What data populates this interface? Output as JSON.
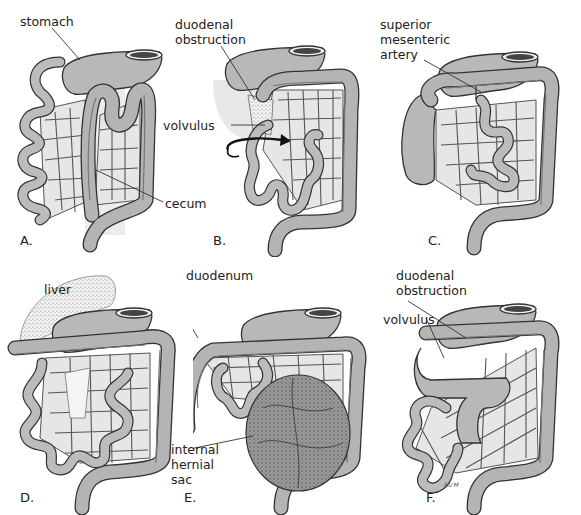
{
  "figure": {
    "panels": [
      {
        "id": "A",
        "panel_label": "A.",
        "callouts": [
          {
            "text": "stomach"
          },
          {
            "text": "cecum"
          }
        ]
      },
      {
        "id": "B",
        "panel_label": "B.",
        "callouts": [
          {
            "text": "duodenal\nobstruction"
          },
          {
            "text": "volvulus"
          }
        ]
      },
      {
        "id": "C",
        "panel_label": "C.",
        "callouts": [
          {
            "text": "superior\nmesenteric\nartery"
          }
        ]
      },
      {
        "id": "D",
        "panel_label": "D.",
        "callouts": [
          {
            "text": "liver"
          }
        ]
      },
      {
        "id": "E",
        "panel_label": "E.",
        "callouts": [
          {
            "text": "duodenum"
          },
          {
            "text": "internal\nhernial\nsac"
          }
        ]
      },
      {
        "id": "F",
        "panel_label": "F.",
        "callouts": [
          {
            "text": "duodenal\nobstruction"
          },
          {
            "text": "volvulus"
          }
        ],
        "signature": "Ru'M"
      }
    ]
  }
}
